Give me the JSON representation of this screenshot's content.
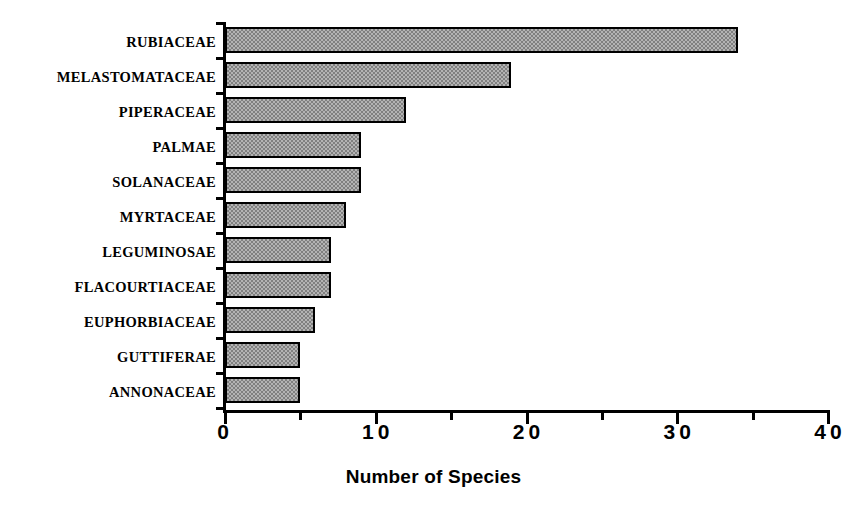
{
  "chart_data": {
    "type": "bar",
    "orientation": "horizontal",
    "title": "",
    "xlabel": "Number of Species",
    "ylabel": "",
    "xlim": [
      0,
      40
    ],
    "grid": false,
    "legend": null,
    "x_major_ticks": [
      "0",
      "10",
      "20",
      "30",
      "40"
    ],
    "x_major_tick_values": [
      0,
      10,
      20,
      30,
      40
    ],
    "x_minor_tick_values": [
      5,
      15,
      25,
      35
    ],
    "categories": [
      "RUBIACEAE",
      "MELASTOMATACEAE",
      "PIPERACEAE",
      "PALMAE",
      "SOLANACEAE",
      "MYRTACEAE",
      "LEGUMINOSAE",
      "FLACOURTIACEAE",
      "EUPHORBIACEAE",
      "GUTTIFERAE",
      "ANNONACEAE"
    ],
    "values": [
      34,
      19,
      12,
      9,
      9,
      8,
      7,
      7,
      6,
      5,
      5
    ],
    "bar_fill_color": "#808080",
    "bar_border_color": "#000000",
    "axis_color": "#000000",
    "background_color": "#ffffff"
  }
}
